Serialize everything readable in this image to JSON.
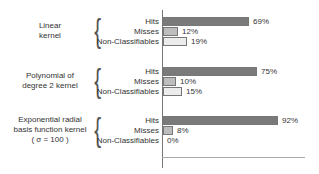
{
  "chart_data": {
    "type": "bar",
    "orientation": "horizontal",
    "title": "",
    "xlabel": "",
    "ylabel": "",
    "xlim": [
      0,
      100
    ],
    "grid": false,
    "legend": null,
    "unit": "%",
    "categories": [
      "Hits",
      "Misses",
      "Non-Classifiables"
    ],
    "groups": [
      {
        "name": "Linear kernel",
        "label_lines": [
          "Linear",
          "kernel"
        ],
        "values": [
          69,
          12,
          19
        ],
        "labels": [
          "69%",
          "12%",
          "19%"
        ]
      },
      {
        "name": "Polynomial of degree 2 kernel",
        "label_lines": [
          "Polynomial of",
          "degree 2 kernel"
        ],
        "values": [
          75,
          10,
          15
        ],
        "labels": [
          "75%",
          "10%",
          "15%"
        ]
      },
      {
        "name": "Exponential radial basis function kernel ( σ = 100 )",
        "label_lines": [
          "Exponential radial",
          "basis function kernel",
          "( σ = 100 )"
        ],
        "values": [
          92,
          8,
          0
        ],
        "labels": [
          "92%",
          "8%",
          "0%"
        ]
      }
    ],
    "colors": {
      "Hits": "#7a7a7a",
      "Misses": "#bdbdbd",
      "Non-Classifiables": "#ececec"
    }
  }
}
